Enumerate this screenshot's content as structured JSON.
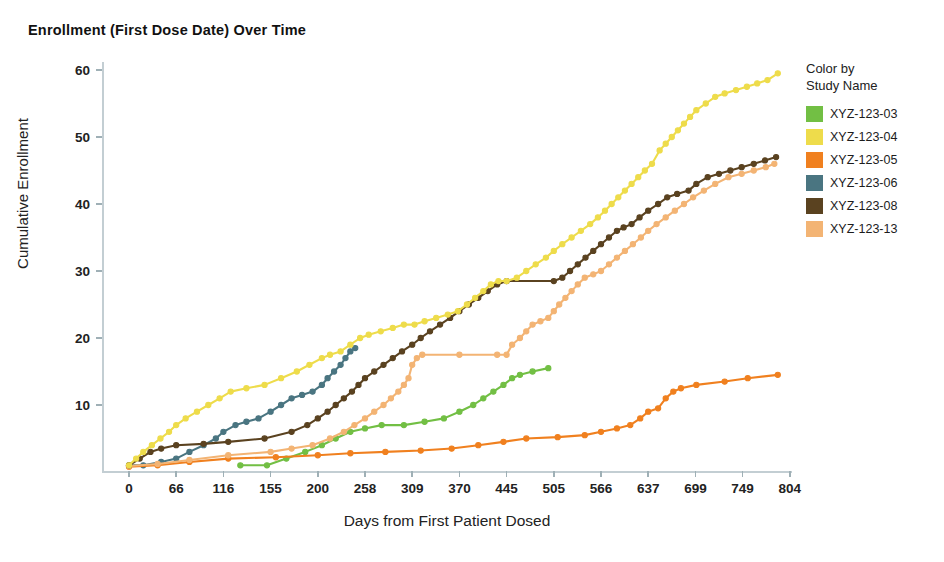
{
  "title": "Enrollment (First Dose Date) Over Time",
  "legend": {
    "heading_line1": "Color by",
    "heading_line2": "Study Name"
  },
  "axes": {
    "y_title": "Cumulative Enrollment",
    "x_title": "Days from First Patient Dosed"
  },
  "chart_data": {
    "type": "line",
    "title": "Enrollment (First Dose Date) Over Time",
    "xlabel": "Days from First Patient Dosed",
    "ylabel": "Cumulative Enrollment",
    "grid": false,
    "legend_position": "right",
    "legend_title": "Color by Study Name",
    "x_tick_labels": [
      "0",
      "66",
      "116",
      "155",
      "200",
      "258",
      "309",
      "370",
      "445",
      "505",
      "566",
      "637",
      "699",
      "749",
      "804"
    ],
    "x_tick_values": [
      0,
      66,
      116,
      155,
      200,
      258,
      309,
      370,
      445,
      505,
      566,
      637,
      699,
      749,
      804
    ],
    "xlim": [
      -12,
      830
    ],
    "y_tick_labels": [
      "10",
      "20",
      "30",
      "40",
      "50",
      "60"
    ],
    "y_tick_values": [
      10,
      20,
      30,
      40,
      50,
      60
    ],
    "ylim": [
      0,
      62
    ],
    "colors": {
      "XYZ-123-03": "#72bf44",
      "XYZ-123-04": "#eedc4b",
      "XYZ-123-05": "#f0801f",
      "XYZ-123-06": "#4a7581",
      "XYZ-123-08": "#5a4220",
      "XYZ-123-13": "#f3b474"
    },
    "series": [
      {
        "name": "XYZ-123-03",
        "color": "#72bf44",
        "points": [
          [
            130,
            1
          ],
          [
            152,
            1
          ],
          [
            170,
            2
          ],
          [
            188,
            3
          ],
          [
            205,
            4
          ],
          [
            222,
            5
          ],
          [
            240,
            6
          ],
          [
            258,
            6.5
          ],
          [
            276,
            7
          ],
          [
            300,
            7
          ],
          [
            325,
            7.5
          ],
          [
            350,
            8
          ],
          [
            370,
            9
          ],
          [
            392,
            10
          ],
          [
            408,
            11
          ],
          [
            424,
            12
          ],
          [
            440,
            13
          ],
          [
            452,
            14
          ],
          [
            462,
            14.5
          ],
          [
            478,
            15
          ],
          [
            498,
            15.5
          ]
        ]
      },
      {
        "name": "XYZ-123-04",
        "color": "#eedc4b",
        "points": [
          [
            0,
            1
          ],
          [
            10,
            2
          ],
          [
            20,
            3
          ],
          [
            32,
            4
          ],
          [
            44,
            5
          ],
          [
            56,
            6
          ],
          [
            66,
            7
          ],
          [
            76,
            8
          ],
          [
            88,
            9
          ],
          [
            100,
            10
          ],
          [
            112,
            11
          ],
          [
            122,
            12
          ],
          [
            135,
            12.5
          ],
          [
            150,
            13
          ],
          [
            165,
            14
          ],
          [
            180,
            15
          ],
          [
            192,
            16
          ],
          [
            205,
            17
          ],
          [
            215,
            17.5
          ],
          [
            228,
            18
          ],
          [
            240,
            19
          ],
          [
            252,
            20
          ],
          [
            262,
            20.5
          ],
          [
            275,
            21
          ],
          [
            288,
            21.5
          ],
          [
            300,
            22
          ],
          [
            312,
            22
          ],
          [
            325,
            22.5
          ],
          [
            340,
            23
          ],
          [
            355,
            23.5
          ],
          [
            368,
            24
          ],
          [
            382,
            25
          ],
          [
            395,
            26
          ],
          [
            408,
            27
          ],
          [
            420,
            28
          ],
          [
            432,
            28.5
          ],
          [
            445,
            28.5
          ],
          [
            458,
            29
          ],
          [
            470,
            30
          ],
          [
            482,
            31
          ],
          [
            495,
            32
          ],
          [
            505,
            33
          ],
          [
            516,
            34
          ],
          [
            528,
            35
          ],
          [
            540,
            36
          ],
          [
            552,
            37
          ],
          [
            562,
            38
          ],
          [
            572,
            39
          ],
          [
            582,
            40
          ],
          [
            592,
            41
          ],
          [
            602,
            42
          ],
          [
            612,
            43
          ],
          [
            622,
            44
          ],
          [
            632,
            45
          ],
          [
            642,
            46
          ],
          [
            652,
            48
          ],
          [
            660,
            49
          ],
          [
            668,
            50
          ],
          [
            676,
            51
          ],
          [
            684,
            52
          ],
          [
            692,
            53
          ],
          [
            700,
            54
          ],
          [
            710,
            55
          ],
          [
            720,
            56
          ],
          [
            730,
            56.5
          ],
          [
            742,
            57
          ],
          [
            754,
            57.5
          ],
          [
            766,
            58
          ],
          [
            778,
            58.5
          ],
          [
            790,
            59.5
          ]
        ]
      },
      {
        "name": "XYZ-123-05",
        "color": "#f0801f",
        "points": [
          [
            0,
            0.8
          ],
          [
            40,
            1
          ],
          [
            80,
            1.5
          ],
          [
            120,
            2
          ],
          [
            160,
            2.2
          ],
          [
            200,
            2.5
          ],
          [
            240,
            2.8
          ],
          [
            280,
            3
          ],
          [
            320,
            3.2
          ],
          [
            360,
            3.5
          ],
          [
            400,
            4
          ],
          [
            440,
            4.5
          ],
          [
            470,
            5
          ],
          [
            510,
            5.2
          ],
          [
            545,
            5.5
          ],
          [
            566,
            6
          ],
          [
            590,
            6.5
          ],
          [
            610,
            7
          ],
          [
            625,
            8
          ],
          [
            637,
            9
          ],
          [
            650,
            9.5
          ],
          [
            660,
            11
          ],
          [
            670,
            12
          ],
          [
            680,
            12.5
          ],
          [
            700,
            13
          ],
          [
            730,
            13.5
          ],
          [
            755,
            14
          ],
          [
            790,
            14.5
          ]
        ]
      },
      {
        "name": "XYZ-123-06",
        "color": "#4a7581",
        "points": [
          [
            0,
            1
          ],
          [
            20,
            1
          ],
          [
            45,
            1.5
          ],
          [
            66,
            2
          ],
          [
            80,
            3
          ],
          [
            95,
            4
          ],
          [
            108,
            5
          ],
          [
            116,
            6
          ],
          [
            126,
            7
          ],
          [
            135,
            7.5
          ],
          [
            145,
            8
          ],
          [
            155,
            9
          ],
          [
            165,
            10
          ],
          [
            175,
            11
          ],
          [
            185,
            11.5
          ],
          [
            195,
            12
          ],
          [
            205,
            13
          ],
          [
            212,
            14
          ],
          [
            220,
            15
          ],
          [
            228,
            16
          ],
          [
            234,
            17
          ],
          [
            240,
            18
          ],
          [
            246,
            18.5
          ]
        ]
      },
      {
        "name": "XYZ-123-08",
        "color": "#5a4220",
        "points": [
          [
            0,
            1
          ],
          [
            15,
            2
          ],
          [
            30,
            3
          ],
          [
            45,
            3.5
          ],
          [
            66,
            4
          ],
          [
            95,
            4.2
          ],
          [
            120,
            4.5
          ],
          [
            150,
            5
          ],
          [
            175,
            6
          ],
          [
            190,
            7
          ],
          [
            200,
            8
          ],
          [
            212,
            9
          ],
          [
            222,
            10
          ],
          [
            232,
            11
          ],
          [
            242,
            12
          ],
          [
            250,
            13
          ],
          [
            258,
            14
          ],
          [
            268,
            15
          ],
          [
            278,
            16
          ],
          [
            288,
            17
          ],
          [
            298,
            18
          ],
          [
            309,
            19
          ],
          [
            320,
            20
          ],
          [
            332,
            21
          ],
          [
            345,
            22
          ],
          [
            358,
            23
          ],
          [
            370,
            24
          ],
          [
            385,
            25
          ],
          [
            400,
            26
          ],
          [
            415,
            27
          ],
          [
            430,
            28
          ],
          [
            445,
            28.5
          ],
          [
            505,
            28.5
          ],
          [
            516,
            29
          ],
          [
            526,
            30
          ],
          [
            536,
            31
          ],
          [
            546,
            32
          ],
          [
            556,
            33
          ],
          [
            566,
            34
          ],
          [
            578,
            35
          ],
          [
            590,
            36
          ],
          [
            600,
            36.5
          ],
          [
            612,
            37
          ],
          [
            624,
            38
          ],
          [
            637,
            39
          ],
          [
            650,
            40
          ],
          [
            662,
            41
          ],
          [
            675,
            41.5
          ],
          [
            690,
            42
          ],
          [
            700,
            43
          ],
          [
            712,
            44
          ],
          [
            724,
            44.5
          ],
          [
            736,
            45
          ],
          [
            748,
            45.5
          ],
          [
            762,
            46
          ],
          [
            775,
            46.5
          ],
          [
            788,
            47
          ]
        ]
      },
      {
        "name": "XYZ-123-13",
        "color": "#f3b474",
        "points": [
          [
            0,
            0.9
          ],
          [
            40,
            1.2
          ],
          [
            80,
            1.8
          ],
          [
            120,
            2.5
          ],
          [
            155,
            3
          ],
          [
            175,
            3.5
          ],
          [
            195,
            4
          ],
          [
            215,
            5
          ],
          [
            232,
            6
          ],
          [
            245,
            7
          ],
          [
            258,
            8
          ],
          [
            268,
            9
          ],
          [
            278,
            10
          ],
          [
            286,
            11
          ],
          [
            294,
            12
          ],
          [
            300,
            13
          ],
          [
            305,
            14
          ],
          [
            309,
            16
          ],
          [
            315,
            17
          ],
          [
            322,
            17.5
          ],
          [
            370,
            17.5
          ],
          [
            430,
            17.5
          ],
          [
            445,
            17.5
          ],
          [
            452,
            19
          ],
          [
            462,
            20
          ],
          [
            470,
            21
          ],
          [
            478,
            22
          ],
          [
            488,
            22.5
          ],
          [
            498,
            23
          ],
          [
            505,
            24
          ],
          [
            512,
            25
          ],
          [
            520,
            26
          ],
          [
            528,
            27
          ],
          [
            536,
            28
          ],
          [
            545,
            29
          ],
          [
            556,
            29.5
          ],
          [
            566,
            30
          ],
          [
            578,
            31
          ],
          [
            590,
            32
          ],
          [
            602,
            33
          ],
          [
            614,
            34
          ],
          [
            626,
            35
          ],
          [
            637,
            36
          ],
          [
            648,
            37
          ],
          [
            660,
            38
          ],
          [
            672,
            39
          ],
          [
            684,
            40
          ],
          [
            696,
            41
          ],
          [
            708,
            42
          ],
          [
            720,
            43
          ],
          [
            734,
            44
          ],
          [
            748,
            44.5
          ],
          [
            762,
            45
          ],
          [
            776,
            45.5
          ],
          [
            786,
            46
          ]
        ]
      }
    ]
  }
}
